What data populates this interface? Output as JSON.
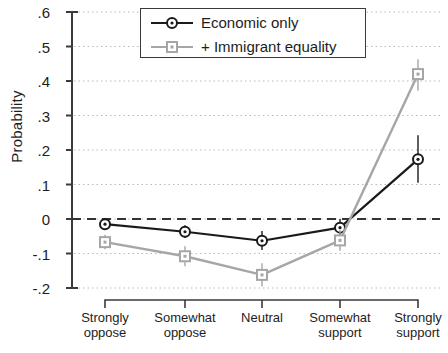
{
  "chart_data": {
    "type": "line",
    "title": "",
    "xlabel": "",
    "ylabel": "Probability",
    "ylim": [
      -0.2,
      0.6
    ],
    "ytick_values": [
      0.6,
      0.5,
      0.4,
      0.3,
      0.2,
      0.1,
      0,
      -0.1,
      -0.2
    ],
    "ytick_labels": [
      ".6",
      ".5",
      ".4",
      ".3",
      ".2",
      ".1",
      "0",
      "-.1",
      "-.2"
    ],
    "grid": true,
    "grid_style": "dotted horizontal",
    "zero_reference_line": {
      "value": 0,
      "style": "dashed",
      "color": "#333333"
    },
    "legend_position": "top-center",
    "categories": [
      "Strongly oppose",
      "Somewhat oppose",
      "Neutral",
      "Somewhat support",
      "Strongly support"
    ],
    "category_lines": [
      [
        "Strongly",
        "oppose"
      ],
      [
        "Somewhat",
        "oppose"
      ],
      [
        "Neutral",
        ""
      ],
      [
        "Somewhat",
        "support"
      ],
      [
        "Strongly",
        "support"
      ]
    ],
    "series": [
      {
        "name": "Economic only",
        "color": "#1a1a1a",
        "marker": "circle",
        "values": [
          -0.015,
          -0.037,
          -0.063,
          -0.025,
          0.173
        ],
        "error_low": [
          -0.03,
          -0.055,
          -0.09,
          -0.05,
          0.105
        ],
        "error_high": [
          0.0,
          -0.018,
          -0.035,
          0.0,
          0.243
        ]
      },
      {
        "name": "+ Immigrant equality",
        "color": "#a6a6a6",
        "marker": "square",
        "values": [
          -0.067,
          -0.108,
          -0.162,
          -0.062,
          0.42
        ],
        "error_low": [
          -0.088,
          -0.137,
          -0.196,
          -0.092,
          0.372
        ],
        "error_high": [
          -0.046,
          -0.079,
          -0.128,
          -0.032,
          0.463
        ]
      }
    ]
  },
  "legend": {
    "entries": [
      {
        "label": "Economic only"
      },
      {
        "label": "+ Immigrant equality"
      }
    ]
  }
}
